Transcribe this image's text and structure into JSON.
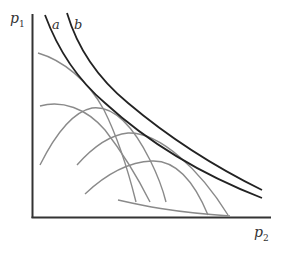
{
  "figure": {
    "axis_labels": {
      "y": "p",
      "y_sub": "1",
      "x": "p",
      "x_sub": "2"
    },
    "curve_labels": {
      "a": "a",
      "b": "b"
    },
    "colors": {
      "axis": "#333333",
      "curve_main": "#222222",
      "curve_secondary": "#8a8a8a"
    }
  }
}
